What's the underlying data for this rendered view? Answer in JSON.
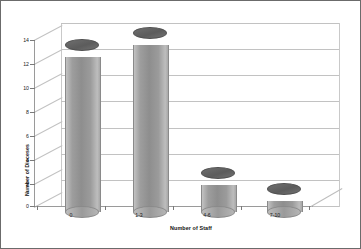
{
  "chart_data": {
    "type": "bar",
    "title": "",
    "subtitle": "",
    "xlabel": "Number of Staff",
    "ylabel": "Number of Dioceses",
    "categories": [
      "0",
      "1-3",
      "4-6",
      "7-10"
    ],
    "values": [
      12.3,
      13.2,
      2.5,
      1.3
    ],
    "series": [
      {
        "name": "Number of Dioceses",
        "values": [
          12.3,
          13.2,
          2.5,
          1.3
        ]
      }
    ],
    "ylim": [
      0,
      14
    ],
    "ytick_values": [
      0,
      2,
      4,
      6,
      8,
      10,
      12,
      14
    ],
    "ytick_labels": [
      "0",
      "2",
      "4",
      "6",
      "8",
      "10",
      "12",
      "14"
    ],
    "grid": true,
    "grid_axis": "y",
    "legend": false,
    "legend_position": "none",
    "style": "3d-cylinder",
    "bar_color": "#9a9a9a",
    "bar_top_color": "#5c5c5c",
    "grid_color": "#c2c2c2",
    "axis_color": "#9a9a9a",
    "background_color": "#ffffff",
    "border_color": "#6b6b6b",
    "text_color": "#222222"
  }
}
